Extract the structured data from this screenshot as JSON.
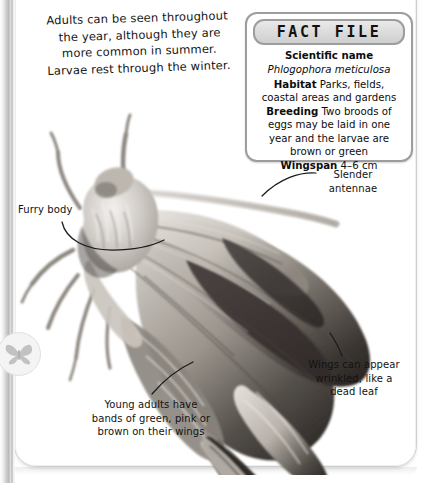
{
  "page": {
    "intro_lines": [
      "Adults can be seen throughout",
      "the year, although they are",
      "more common in summer.",
      "Larvae rest through the winter."
    ],
    "watermark_icon": "moth-silhouette-icon",
    "subject_photo": "moth-photograph"
  },
  "fact_file": {
    "title": "FACT FILE",
    "rows": [
      {
        "label": "Scientific name",
        "value": ""
      },
      {
        "label": "",
        "value": "Phlogophora meticulosa"
      },
      {
        "label": "Habitat",
        "value": "Parks, fields, coastal"
      },
      {
        "label": "",
        "value": "areas and gardens"
      },
      {
        "label": "Breeding",
        "value": "Two broods of eggs"
      },
      {
        "label": "",
        "value": "may be laid in one year and the"
      },
      {
        "label": "",
        "value": "larvae are brown or green"
      },
      {
        "label": "Wingspan",
        "value": "4–6 cm"
      }
    ],
    "scientific_name_label": "Scientific name",
    "scientific_name_value": "Phlogophora meticulosa",
    "habitat_label": "Habitat",
    "habitat_value": "Parks, fields, coastal areas and gardens",
    "breeding_label": "Breeding",
    "breeding_value": "Two broods of eggs may be laid in one year and the larvae are brown or green",
    "wingspan_label": "Wingspan",
    "wingspan_value": "4–6 cm"
  },
  "callouts": {
    "furry_body": "Furry body",
    "slender_antennae_l1": "Slender",
    "slender_antennae_l2": "antennae",
    "wrinkled_l1": "Wings can appear",
    "wrinkled_l2": "wrinkled, like a",
    "wrinkled_l3": "dead leaf",
    "young_l1": "Young adults have",
    "young_l2": "bands of green, pink or",
    "young_l3": "brown on their wings"
  },
  "colors": {
    "page_background": "#ffffff",
    "outer_background": "#d8d8d8",
    "box_border": "#9d9d9d",
    "box_header": "#cfcfcf",
    "text": "#121212",
    "leader_line": "#1a1a1a"
  }
}
